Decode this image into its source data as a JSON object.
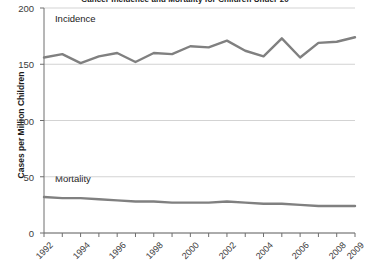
{
  "chart_data": {
    "type": "line",
    "title": "Cancer Incidence and Mortality for Children Under 20",
    "xlabel": "",
    "ylabel": "Cases per Million Children",
    "ylim": [
      0,
      200
    ],
    "yticks": [
      0,
      50,
      100,
      150,
      200
    ],
    "ytick_labels": [
      "0",
      "50",
      "100",
      "150",
      "200"
    ],
    "xlim": [
      1992,
      2009
    ],
    "x": [
      1992,
      1993,
      1994,
      1995,
      1996,
      1997,
      1998,
      1999,
      2000,
      2001,
      2002,
      2003,
      2004,
      2005,
      2006,
      2007,
      2008,
      2009
    ],
    "xticks": [
      1992,
      1993,
      1994,
      1995,
      1996,
      1997,
      1998,
      1999,
      2000,
      2001,
      2002,
      2003,
      2004,
      2005,
      2006,
      2007,
      2008,
      2009
    ],
    "xtick_labels": [
      "1992",
      "",
      "1994",
      "",
      "1996",
      "",
      "1998",
      "",
      "2000",
      "",
      "2002",
      "",
      "2004",
      "",
      "2006",
      "",
      "2008",
      "2009"
    ],
    "grid": true,
    "legend_position": "inline-annotation",
    "series": [
      {
        "name": "Incidence",
        "color": "#808080",
        "values": [
          156,
          159,
          151,
          157,
          160,
          152,
          160,
          159,
          166,
          165,
          171,
          162,
          157,
          173,
          156,
          169,
          170,
          174
        ]
      },
      {
        "name": "Mortality",
        "color": "#808080",
        "values": [
          32,
          31,
          31,
          30,
          29,
          28,
          28,
          27,
          27,
          27,
          28,
          27,
          26,
          26,
          25,
          24,
          24,
          24
        ]
      }
    ],
    "annotations": [
      {
        "text": "Incidence",
        "x": 1992.6,
        "y": 190
      },
      {
        "text": "Mortality",
        "x": 1992.6,
        "y": 48
      }
    ]
  }
}
